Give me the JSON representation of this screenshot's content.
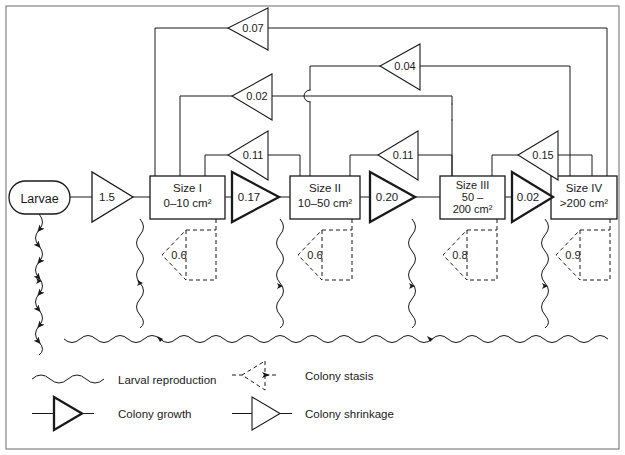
{
  "diagram": {
    "source_node": {
      "label": "Larvae",
      "shape": "stadium"
    },
    "size_classes": [
      {
        "id": "I",
        "name": "Size I",
        "range": "0–10 cm²",
        "lines": [
          "Size I",
          "0–10 cm²"
        ]
      },
      {
        "id": "II",
        "name": "Size II",
        "range": "10–50 cm²",
        "lines": [
          "Size II",
          "10–50 cm²"
        ]
      },
      {
        "id": "III",
        "name": "Size III",
        "range": "50–200 cm²",
        "lines": [
          "Size III",
          "50 –",
          "200 cm²"
        ]
      },
      {
        "id": "IV",
        "name": "Size IV",
        "range": ">200 cm²",
        "lines": [
          "Size IV",
          ">200 cm²"
        ]
      }
    ],
    "recruitment": [
      {
        "from": "Larvae",
        "to": "Size I",
        "value": "1.5",
        "type": "colony growth"
      }
    ],
    "growth_transitions": [
      {
        "from": "Size I",
        "to": "Size II",
        "value": "0.17",
        "type": "colony growth"
      },
      {
        "from": "Size II",
        "to": "Size III",
        "value": "0.20",
        "type": "colony growth"
      },
      {
        "from": "Size III",
        "to": "Size IV",
        "value": "0.02",
        "type": "colony growth"
      }
    ],
    "shrinkage_transitions": [
      {
        "from": "Size II",
        "to": "Size I",
        "value": "0.11",
        "type": "colony shrinkage"
      },
      {
        "from": "Size III",
        "to": "Size II",
        "value": "0.11",
        "type": "colony shrinkage"
      },
      {
        "from": "Size IV",
        "to": "Size III",
        "value": "0.15",
        "type": "colony shrinkage"
      },
      {
        "from": "Size III",
        "to": "Size I",
        "value": "0.02",
        "type": "colony shrinkage"
      },
      {
        "from": "Size IV",
        "to": "Size II",
        "value": "0.04",
        "type": "colony shrinkage"
      },
      {
        "from": "Size IV",
        "to": "Size I",
        "value": "0.07",
        "type": "colony shrinkage"
      }
    ],
    "stasis_loops": [
      {
        "node": "Size I",
        "value": "0.6",
        "type": "colony stasis"
      },
      {
        "node": "Size II",
        "value": "0.6",
        "type": "colony stasis"
      },
      {
        "node": "Size III",
        "value": "0.8",
        "type": "colony stasis"
      },
      {
        "node": "Size IV",
        "value": "0.9",
        "type": "colony stasis"
      }
    ],
    "larval_reproduction": [
      {
        "from": "Size I",
        "to": "Larvae"
      },
      {
        "from": "Size II",
        "to": "Larvae"
      },
      {
        "from": "Size III",
        "to": "Larvae"
      },
      {
        "from": "Size IV",
        "to": "Larvae"
      }
    ]
  },
  "legend": {
    "items": [
      {
        "key": "larval-reproduction",
        "label": "Larval reproduction",
        "symbol": "wavy-line"
      },
      {
        "key": "colony-stasis",
        "label": "Colony stasis",
        "symbol": "dashed-triangle"
      },
      {
        "key": "colony-growth",
        "label": "Colony growth",
        "symbol": "bold-triangle"
      },
      {
        "key": "colony-shrinkage",
        "label": "Colony shrinkage",
        "symbol": "thin-triangle"
      }
    ]
  },
  "colors": {
    "stroke": "#1a1a1a",
    "background": "#ffffff",
    "frame": "#555555"
  }
}
